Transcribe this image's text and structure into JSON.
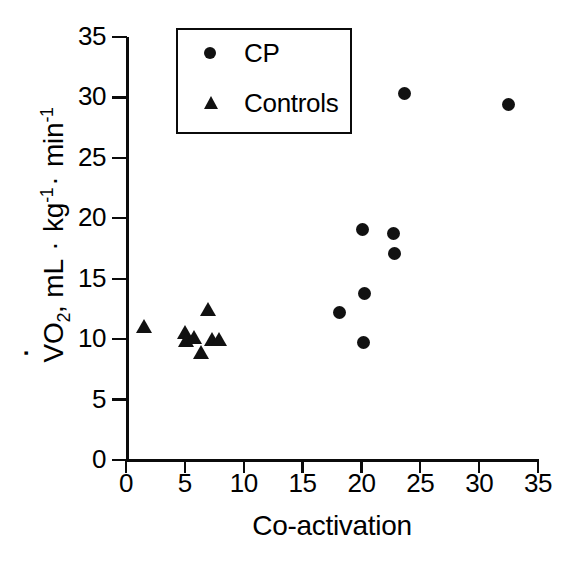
{
  "figure": {
    "kind": "scatter-plot",
    "background_color": "#ffffff",
    "marker_color": "#111111",
    "axis_color": "#0b0b0b"
  },
  "legend": {
    "position": "top-left-inside",
    "entries": [
      {
        "label": "CP",
        "marker": "filled-circle",
        "marker_icon": "circle-icon"
      },
      {
        "label": "Controls",
        "marker": "filled-triangle",
        "marker_icon": "triangle-icon"
      }
    ]
  },
  "axes": {
    "x": {
      "label": "Co-activation",
      "ticks": [
        "0",
        "5",
        "10",
        "15",
        "20",
        "25",
        "30",
        "35"
      ],
      "min": 0,
      "max": 35,
      "step": 5
    },
    "y": {
      "label_parts": {
        "v": "V",
        "o": "O",
        "sub2": "2",
        "comma": ", mL ",
        "middot1": "·",
        "kg": " kg",
        "exp1": "-1",
        "middot2": "·",
        "min": " min",
        "exp2": "-1"
      },
      "label_plain": "VO2, mL · kg-1 · min-1",
      "ticks": [
        "0",
        "5",
        "10",
        "15",
        "20",
        "25",
        "30",
        "35"
      ],
      "min": 0,
      "max": 35,
      "step": 5
    }
  },
  "chart_data": {
    "type": "scatter",
    "title": "",
    "xlabel": "Co-activation",
    "ylabel": "VO2, mL · kg-1 · min-1",
    "xlim": [
      0,
      35
    ],
    "ylim": [
      0,
      35
    ],
    "xticks": [
      0,
      5,
      10,
      15,
      20,
      25,
      30,
      35
    ],
    "yticks": [
      0,
      5,
      10,
      15,
      20,
      25,
      30,
      35
    ],
    "grid": false,
    "legend_position": "upper-left",
    "series": [
      {
        "name": "CP",
        "marker": "circle",
        "color": "#111111",
        "points": [
          {
            "x": 18.1,
            "y": 12.2
          },
          {
            "x": 20.1,
            "y": 19.1
          },
          {
            "x": 20.3,
            "y": 13.8
          },
          {
            "x": 20.2,
            "y": 9.7
          },
          {
            "x": 22.7,
            "y": 18.7
          },
          {
            "x": 22.8,
            "y": 17.1
          },
          {
            "x": 23.7,
            "y": 30.3
          },
          {
            "x": 32.5,
            "y": 29.4
          }
        ]
      },
      {
        "name": "Controls",
        "marker": "triangle",
        "color": "#111111",
        "points": [
          {
            "x": 1.5,
            "y": 11.1
          },
          {
            "x": 5.0,
            "y": 10.6
          },
          {
            "x": 5.1,
            "y": 9.9
          },
          {
            "x": 5.8,
            "y": 10.2
          },
          {
            "x": 6.4,
            "y": 8.9
          },
          {
            "x": 7.0,
            "y": 12.5
          },
          {
            "x": 7.3,
            "y": 10.0
          },
          {
            "x": 7.9,
            "y": 10.0
          }
        ]
      }
    ]
  }
}
